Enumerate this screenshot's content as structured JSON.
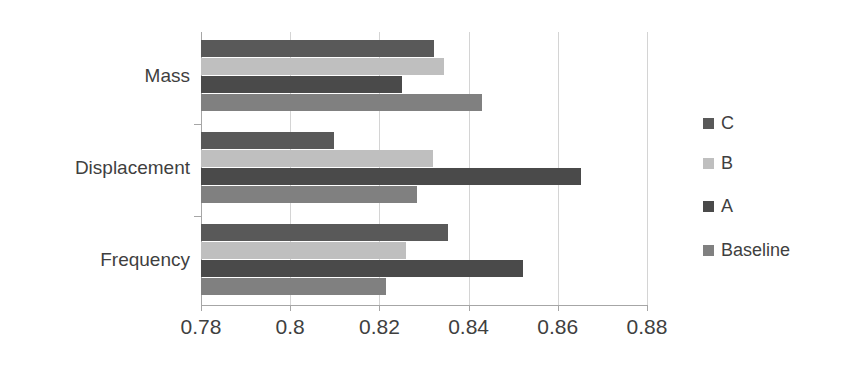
{
  "chart_data": {
    "type": "bar",
    "orientation": "horizontal",
    "title": "",
    "xlabel": "",
    "ylabel": "",
    "categories": [
      "Frequency",
      "Displacement",
      "Mass"
    ],
    "xlim": [
      0.78,
      0.88
    ],
    "xticks": [
      0.78,
      0.8,
      0.82,
      0.84,
      0.86,
      0.88
    ],
    "xtick_labels": [
      "0.78",
      "0.8",
      "0.82",
      "0.84",
      "0.86",
      "0.88"
    ],
    "grid": true,
    "legend_position": "right",
    "series": [
      {
        "name": "C",
        "color": "#595959",
        "values": [
          0.8354,
          0.8098,
          0.8322
        ]
      },
      {
        "name": "B",
        "color": "#bfbfbf",
        "values": [
          0.826,
          0.832,
          0.8345
        ]
      },
      {
        "name": "A",
        "color": "#4a4a4a",
        "values": [
          0.8521,
          0.8652,
          0.8251
        ]
      },
      {
        "name": "Baseline",
        "color": "#808080",
        "values": [
          0.8215,
          0.8284,
          0.843
        ]
      }
    ]
  },
  "legend": {
    "entries": [
      {
        "label": "C",
        "color": "#595959"
      },
      {
        "label": "B",
        "color": "#bfbfbf"
      },
      {
        "label": "A",
        "color": "#4a4a4a"
      },
      {
        "label": "Baseline",
        "color": "#808080"
      }
    ]
  }
}
